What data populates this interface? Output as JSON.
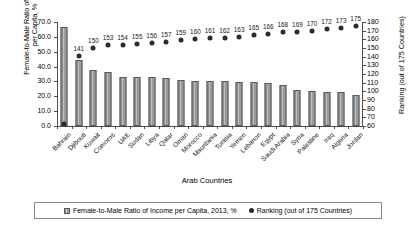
{
  "chart_data": {
    "type": "bar",
    "title": "",
    "xlabel": "Arab Countries",
    "ylabel": "Female-to-Male Ratio of Income per Capita, %",
    "ylabel_line1": "Female-to-Male Ratio of Income",
    "ylabel_line2": "per Capita, %",
    "y2label": "Ranking (out of 175 Countries)",
    "ylim": [
      0,
      70
    ],
    "y2lim": [
      60,
      180
    ],
    "yticks": [
      "0.0",
      "10.0",
      "20.0",
      "30.0",
      "40.0",
      "50.0",
      "60.0",
      "70.0"
    ],
    "y2ticks": [
      "60",
      "70",
      "80",
      "90",
      "100",
      "110",
      "120",
      "130",
      "140",
      "150",
      "160",
      "170",
      "180"
    ],
    "grid": false,
    "legend_position": "bottom",
    "categories": [
      "Bahrain",
      "Djibouti",
      "Kuwait",
      "Comoros",
      "UAE",
      "Sudan",
      "Libya",
      "Qatar",
      "Oman",
      "Morocco",
      "Mauritania",
      "Tunisia",
      "Yemen",
      "Lebanon",
      "Egypt",
      "Saudi Arabia",
      "Syria",
      "Palestine",
      "Iraq",
      "Algeria",
      "Jordan"
    ],
    "series": [
      {
        "name": "Female-to-Male Ratio of Income per Capita, 2013, %",
        "axis": "left",
        "type": "bar",
        "values": [
          66.8,
          44.5,
          38.0,
          36.2,
          33.2,
          33.2,
          32.7,
          32.6,
          31.0,
          30.2,
          30.0,
          30.0,
          29.4,
          29.4,
          29.2,
          27.5,
          24.0,
          23.6,
          22.8,
          22.6,
          21.2
        ]
      },
      {
        "name": "Ranking (out of 175 Countries)",
        "axis": "right",
        "type": "scatter",
        "values": [
          62,
          141,
          150,
          153,
          154,
          155,
          156,
          157,
          159,
          160,
          161,
          162,
          163,
          165,
          166,
          168,
          169,
          170,
          172,
          173,
          175
        ],
        "point_labels": [
          "",
          "141",
          "150",
          "153",
          "154",
          "155",
          "156",
          "157",
          "159",
          "160",
          "161",
          "162",
          "163",
          "165",
          "166",
          "168",
          "169",
          "170",
          "172",
          "173",
          "175"
        ]
      }
    ],
    "colors": {
      "bar": "#8f8f8f",
      "bar_edge": "#5a5a5a",
      "dot": "#2b2b2b",
      "axis": "#4d4d4d",
      "background": "#ffffff"
    }
  },
  "legend": {
    "bar_label": "Female-to-Male Ratio of Income per Capita, 2013, %",
    "dot_label": "Ranking (out of 175 Countries)"
  }
}
